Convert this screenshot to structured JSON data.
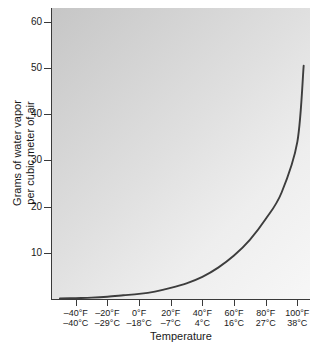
{
  "chart_data": {
    "type": "line",
    "title": "",
    "xlabel": "Temperature",
    "ylabel_line1": "Grams of water vapor",
    "ylabel_line2": "per cubic meter of air",
    "ylim": [
      0,
      63
    ],
    "yticks": [
      10,
      20,
      30,
      40,
      50,
      60
    ],
    "ytick_labels": [
      "10",
      "20",
      "30",
      "40",
      "50",
      "60"
    ],
    "grid": false,
    "legend": "none",
    "line_color": "#3d3d3d",
    "plot_bg_from": "#c6c6c6",
    "plot_bg_to": "#f7f7f7",
    "axis_color": "#3a3a3a",
    "xticks_f": [
      -40,
      -20,
      0,
      20,
      40,
      60,
      80,
      100
    ],
    "xtick_labels": [
      {
        "f": "–40°F",
        "c": "–40°C"
      },
      {
        "f": "–20°F",
        "c": "–29°C"
      },
      {
        "f": "0°F",
        "c": "–18°C"
      },
      {
        "f": "20°F",
        "c": "–7°C"
      },
      {
        "f": "40°F",
        "c": "4°C"
      },
      {
        "f": "60°F",
        "c": "16°C"
      },
      {
        "f": "80°F",
        "c": "27°C"
      },
      {
        "f": "100°F",
        "c": "38°C"
      }
    ],
    "x": [
      -50,
      -40,
      -30,
      -20,
      -10,
      0,
      10,
      20,
      30,
      40,
      50,
      60,
      70,
      80,
      90,
      100,
      104
    ],
    "values": [
      0.1,
      0.2,
      0.3,
      0.5,
      0.8,
      1.1,
      1.6,
      2.4,
      3.4,
      4.8,
      6.8,
      9.4,
      12.8,
      17.3,
      23.0,
      34.0,
      50.5
    ],
    "x_unit": "°F",
    "y_unit": "g/m³"
  }
}
